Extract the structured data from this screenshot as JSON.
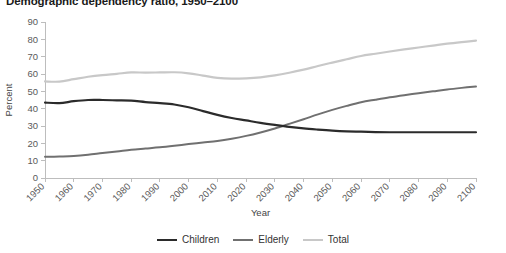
{
  "chart_data": {
    "type": "line",
    "title": "Demographic dependency ratio, 1950–2100",
    "xlabel": "Year",
    "ylabel": "Percent",
    "ylim": [
      0,
      90
    ],
    "xlim": [
      1950,
      2100
    ],
    "ytick_step": 10,
    "xtick_step": 10,
    "grid": false,
    "legend_position": "bottom",
    "yticks": [
      "0",
      "10",
      "20",
      "30",
      "40",
      "50",
      "60",
      "70",
      "80",
      "90"
    ],
    "x": [
      1950,
      1955,
      1960,
      1965,
      1970,
      1975,
      1980,
      1985,
      1990,
      1995,
      2000,
      2005,
      2010,
      2015,
      2020,
      2025,
      2030,
      2035,
      2040,
      2045,
      2050,
      2055,
      2060,
      2065,
      2070,
      2075,
      2080,
      2085,
      2090,
      2095,
      2100
    ],
    "xticks": [
      "1950",
      "1960",
      "1970",
      "1980",
      "1990",
      "2000",
      "2010",
      "2020",
      "2030",
      "2040",
      "2050",
      "2060",
      "2070",
      "2080",
      "2090",
      "2100"
    ],
    "series": [
      {
        "name": "Children",
        "color": "#2b2b2b",
        "width": 2.2,
        "values": [
          43.5,
          43.2,
          44.3,
          45.0,
          45.0,
          44.8,
          44.6,
          43.8,
          43.2,
          42.4,
          40.8,
          38.6,
          36.4,
          34.6,
          33.2,
          31.8,
          30.6,
          29.5,
          28.6,
          27.9,
          27.3,
          26.9,
          26.7,
          26.5,
          26.4,
          26.4,
          26.4,
          26.4,
          26.4,
          26.4,
          26.4
        ]
      },
      {
        "name": "Elderly",
        "color": "#707070",
        "width": 2.0,
        "values": [
          12.2,
          12.4,
          12.7,
          13.4,
          14.4,
          15.3,
          16.3,
          17.0,
          17.7,
          18.6,
          19.6,
          20.5,
          21.4,
          22.7,
          24.3,
          26.3,
          28.6,
          31.2,
          33.9,
          36.7,
          39.3,
          41.6,
          43.7,
          45.2,
          46.6,
          47.8,
          48.9,
          50.0,
          51.1,
          52.0,
          52.8
        ]
      },
      {
        "name": "Total",
        "color": "#c8c8c8",
        "width": 2.2,
        "values": [
          55.7,
          55.6,
          57.0,
          58.4,
          59.4,
          60.1,
          60.9,
          60.8,
          60.9,
          61.0,
          60.4,
          59.1,
          57.8,
          57.3,
          57.5,
          58.1,
          59.2,
          60.7,
          62.5,
          64.6,
          66.6,
          68.5,
          70.4,
          71.7,
          73.0,
          74.2,
          75.3,
          76.4,
          77.5,
          78.4,
          79.2
        ]
      }
    ]
  }
}
